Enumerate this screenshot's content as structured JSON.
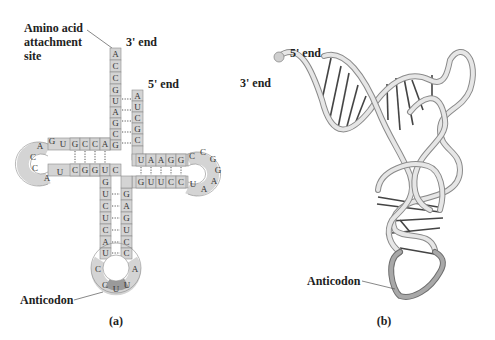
{
  "panel_a": {
    "caption": "(a)",
    "labels": {
      "amino_acid_site_line1": "Amino acid",
      "amino_acid_site_line2": "attachment",
      "amino_acid_site_line3": "site",
      "three_prime": "3' end",
      "five_prime": "5' end",
      "anticodon": "Anticodon"
    },
    "acceptor_3prime_strand": [
      "A",
      "C",
      "C",
      "G",
      "U",
      "A",
      "G",
      "C",
      "G"
    ],
    "acceptor_5prime_strand": [
      "A",
      "U",
      "C",
      "G",
      "C"
    ],
    "d_arm_top": [
      "G",
      "C",
      "C",
      "A"
    ],
    "d_loop": [
      "U",
      "G",
      "A",
      "C",
      "C",
      "A",
      "U"
    ],
    "d_arm_bottom": [
      "C",
      "G",
      "G",
      "U"
    ],
    "t_arm_top": [
      "U",
      "A",
      "A",
      "G",
      "G"
    ],
    "t_loop": [
      "C",
      "C",
      "G",
      "G",
      "A",
      "A",
      "U"
    ],
    "t_arm_bottom": [
      "G",
      "U",
      "U",
      "C",
      "C"
    ],
    "anticodon_stem_left": [
      "C",
      "G",
      "U",
      "C",
      "U",
      "C",
      "A",
      "G",
      "U"
    ],
    "anticodon_stem_right": [
      "G",
      "A",
      "G",
      "U",
      "C",
      "C"
    ],
    "anticodon_loop": [
      "C",
      "C",
      "U",
      "U",
      "A"
    ],
    "anticodon_bases": [
      "C",
      "U",
      "U"
    ]
  },
  "panel_b": {
    "caption": "(b)",
    "labels": {
      "five_prime": "5' end",
      "three_prime": "3' end",
      "anticodon": "Anticodon"
    }
  }
}
